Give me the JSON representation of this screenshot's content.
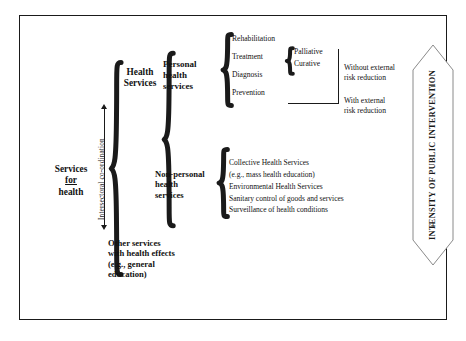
{
  "figure": {
    "border_color": "#1a1a1a",
    "background": "#ffffff"
  },
  "root": {
    "label_line1": "Services",
    "label_line2": "for",
    "label_line3": "health"
  },
  "branches": {
    "health_services": {
      "label_line1": "Health",
      "label_line2": "Services"
    },
    "other_services": {
      "label_line1": "Other services",
      "label_line2": "with health effects",
      "label_line3": "(e.g., general",
      "label_line4": "education)"
    }
  },
  "coordination": {
    "label": "Intersectoral co-ordination"
  },
  "health_services_children": {
    "personal": {
      "label_line1": "Personal",
      "label_line2": "health",
      "label_line3": "services"
    },
    "non_personal": {
      "label_line1": "Non-personal",
      "label_line2": "health",
      "label_line3": "services"
    }
  },
  "personal_items": [
    {
      "label": "Rehabilitation"
    },
    {
      "label": "Treatment"
    },
    {
      "label": "Diagnosis"
    },
    {
      "label": "Prevention"
    }
  ],
  "treatment_subitems": [
    {
      "label": "Palliative"
    },
    {
      "label": "Curative"
    }
  ],
  "risk_groups": {
    "without": {
      "line1": "Without external",
      "line2": "risk reduction"
    },
    "with": {
      "line1": "With external",
      "line2": "risk reduction"
    }
  },
  "non_personal_items": [
    {
      "label": "Collective Health Services"
    },
    {
      "label": "(e.g., mass health education)"
    },
    {
      "label": "Environmental Health Services"
    },
    {
      "label": "Sanitary control of goods and services"
    },
    {
      "label": "Surveillance of health conditions"
    }
  ],
  "intensity_banner": {
    "label": "INTENSITY OF PUBLIC INTERVENTION",
    "top_sign": "–",
    "bottom_sign": "+"
  }
}
